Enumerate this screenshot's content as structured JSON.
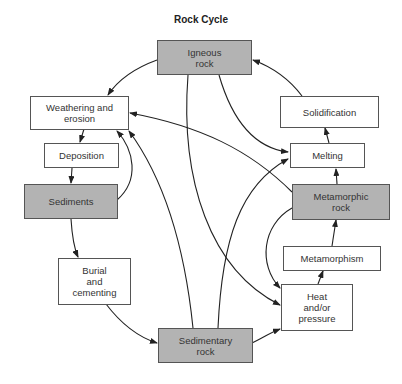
{
  "title": "Rock Cycle",
  "colors": {
    "rock_fill": "#b3b3b3",
    "process_fill": "#ffffff",
    "stroke": "#222222"
  },
  "nodes": {
    "igneous": {
      "label": "Igneous\nrock",
      "type": "rock"
    },
    "weathering": {
      "label": "Weathering and\nerosion",
      "type": "process"
    },
    "solidification": {
      "label": "Solidification",
      "type": "process"
    },
    "deposition": {
      "label": "Deposition",
      "type": "process"
    },
    "melting": {
      "label": "Melting",
      "type": "process"
    },
    "sediments": {
      "label": "Sediments",
      "type": "rock"
    },
    "metamorphic": {
      "label": "Metamorphic\nrock",
      "type": "rock"
    },
    "metamorphism": {
      "label": "Metamorphism",
      "type": "process"
    },
    "burial": {
      "label": "Burial\nand\ncementing",
      "type": "process"
    },
    "heat": {
      "label": "Heat\nand/or\npressure",
      "type": "process"
    },
    "sedimentary": {
      "label": "Sedimentary\nrock",
      "type": "rock"
    }
  },
  "edges": [
    {
      "from": "igneous",
      "to": "weathering"
    },
    {
      "from": "igneous",
      "to": "melting"
    },
    {
      "from": "igneous",
      "to": "heat"
    },
    {
      "from": "solidification",
      "to": "igneous"
    },
    {
      "from": "melting",
      "to": "solidification"
    },
    {
      "from": "metamorphic",
      "to": "melting"
    },
    {
      "from": "metamorphic",
      "to": "weathering"
    },
    {
      "from": "metamorphic",
      "to": "heat"
    },
    {
      "from": "weathering",
      "to": "deposition"
    },
    {
      "from": "deposition",
      "to": "sediments"
    },
    {
      "from": "sediments",
      "to": "weathering"
    },
    {
      "from": "sediments",
      "to": "burial"
    },
    {
      "from": "burial",
      "to": "sedimentary"
    },
    {
      "from": "sedimentary",
      "to": "weathering"
    },
    {
      "from": "sedimentary",
      "to": "melting"
    },
    {
      "from": "sedimentary",
      "to": "heat"
    },
    {
      "from": "heat",
      "to": "metamorphism"
    },
    {
      "from": "metamorphism",
      "to": "metamorphic"
    }
  ]
}
